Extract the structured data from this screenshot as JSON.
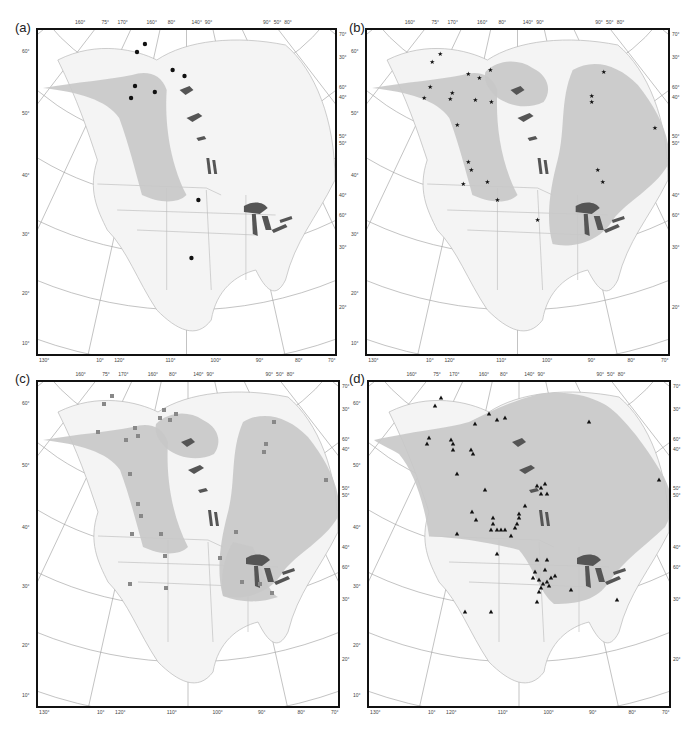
{
  "figure": {
    "panels": [
      {
        "label": "(a)",
        "marker": "circle",
        "frame": {
          "x": 36,
          "y": 28,
          "w": 301,
          "h": 328
        },
        "label_pos": {
          "x": 15,
          "y": 20
        },
        "ranges": [
          "alaska-west"
        ],
        "points": [
          [
            108,
            14
          ],
          [
            100,
            22
          ],
          [
            136,
            40
          ],
          [
            148,
            46
          ],
          [
            98,
            56
          ],
          [
            118,
            62
          ],
          [
            94,
            68
          ],
          [
            162,
            170
          ],
          [
            155,
            228
          ]
        ]
      },
      {
        "label": "(b)",
        "marker": "star",
        "frame": {
          "x": 365,
          "y": 28,
          "w": 305,
          "h": 328
        },
        "label_pos": {
          "x": 349,
          "y": 20
        },
        "ranges": [
          "alaska-west",
          "yukon-north",
          "east"
        ],
        "points": [
          [
            73,
            24
          ],
          [
            65,
            32
          ],
          [
            101,
            44
          ],
          [
            112,
            48
          ],
          [
            123,
            40
          ],
          [
            63,
            57
          ],
          [
            57,
            68
          ],
          [
            85,
            63
          ],
          [
            83,
            69
          ],
          [
            108,
            70
          ],
          [
            124,
            72
          ],
          [
            90,
            95
          ],
          [
            101,
            132
          ],
          [
            104,
            140
          ],
          [
            120,
            152
          ],
          [
            96,
            154
          ],
          [
            130,
            170
          ],
          [
            170,
            190
          ],
          [
            236,
            42
          ],
          [
            224,
            66
          ],
          [
            224,
            72
          ],
          [
            287,
            98
          ],
          [
            230,
            140
          ],
          [
            235,
            152
          ]
        ]
      },
      {
        "label": "(c)",
        "marker": "square",
        "frame": {
          "x": 36,
          "y": 380,
          "w": 304,
          "h": 328
        },
        "label_pos": {
          "x": 15,
          "y": 371
        },
        "ranges": [
          "alaska-west",
          "yukon-north",
          "east",
          "great-lakes-south"
        ],
        "points": [
          [
            74,
            14
          ],
          [
            66,
            22
          ],
          [
            97,
            46
          ],
          [
            100,
            54
          ],
          [
            60,
            50
          ],
          [
            88,
            58
          ],
          [
            122,
            36
          ],
          [
            126,
            28
          ],
          [
            132,
            38
          ],
          [
            138,
            32
          ],
          [
            92,
            92
          ],
          [
            100,
            122
          ],
          [
            103,
            134
          ],
          [
            94,
            152
          ],
          [
            123,
            152
          ],
          [
            127,
            174
          ],
          [
            92,
            202
          ],
          [
            128,
            206
          ],
          [
            236,
            40
          ],
          [
            228,
            62
          ],
          [
            226,
            70
          ],
          [
            288,
            98
          ],
          [
            198,
            150
          ],
          [
            182,
            176
          ],
          [
            204,
            200
          ],
          [
            222,
            202
          ],
          [
            234,
            211
          ]
        ]
      },
      {
        "label": "(d)",
        "marker": "triangle",
        "frame": {
          "x": 367,
          "y": 380,
          "w": 304,
          "h": 328
        },
        "label_pos": {
          "x": 349,
          "y": 371
        },
        "ranges": [
          "continental"
        ],
        "points": [
          [
            72,
            16
          ],
          [
            66,
            24
          ],
          [
            106,
            42
          ],
          [
            120,
            32
          ],
          [
            128,
            38
          ],
          [
            136,
            36
          ],
          [
            60,
            56
          ],
          [
            58,
            62
          ],
          [
            82,
            58
          ],
          [
            84,
            62
          ],
          [
            84,
            68
          ],
          [
            102,
            68
          ],
          [
            104,
            72
          ],
          [
            88,
            92
          ],
          [
            116,
            108
          ],
          [
            103,
            130
          ],
          [
            107,
            138
          ],
          [
            124,
            136
          ],
          [
            124,
            142
          ],
          [
            122,
            148
          ],
          [
            128,
            148
          ],
          [
            132,
            148
          ],
          [
            136,
            148
          ],
          [
            142,
            154
          ],
          [
            146,
            146
          ],
          [
            150,
            132
          ],
          [
            148,
            142
          ],
          [
            150,
            136
          ],
          [
            156,
            124
          ],
          [
            168,
            104
          ],
          [
            172,
            106
          ],
          [
            176,
            102
          ],
          [
            172,
            112
          ],
          [
            178,
            112
          ],
          [
            88,
            152
          ],
          [
            128,
            172
          ],
          [
            168,
            178
          ],
          [
            178,
            178
          ],
          [
            166,
            190
          ],
          [
            164,
            196
          ],
          [
            170,
            198
          ],
          [
            174,
            202
          ],
          [
            178,
            200
          ],
          [
            176,
            188
          ],
          [
            182,
            196
          ],
          [
            172,
            206
          ],
          [
            170,
            210
          ],
          [
            180,
            204
          ],
          [
            186,
            194
          ],
          [
            168,
            220
          ],
          [
            202,
            208
          ],
          [
            248,
            218
          ],
          [
            122,
            230
          ],
          [
            96,
            230
          ],
          [
            220,
            40
          ],
          [
            290,
            98
          ]
        ]
      }
    ],
    "top_ticks": [
      "160°",
      "75°",
      "170°",
      "160°",
      "80°",
      "140°",
      "90°",
      "90°",
      "50°",
      "80°",
      "70°",
      "20°"
    ],
    "bottom_ticks": [
      "130°",
      "10°",
      "120°",
      "110°",
      "100°",
      "90°",
      "80°",
      "70°"
    ],
    "left_ticks": [
      "60°",
      "50°",
      "40°",
      "30°",
      "20°",
      "10°"
    ],
    "right_ticks": [
      "70°",
      "30°",
      "60°",
      "40°",
      "50°",
      "50°",
      "40°",
      "60°",
      "30°",
      "20°"
    ],
    "colors": {
      "range_fill": "#c8c8c8",
      "land": "#f4f4f4",
      "lakes": "#555555",
      "borders": "#b8b8b8",
      "graticule": "#9a9a9a",
      "marker": "#111111"
    }
  }
}
